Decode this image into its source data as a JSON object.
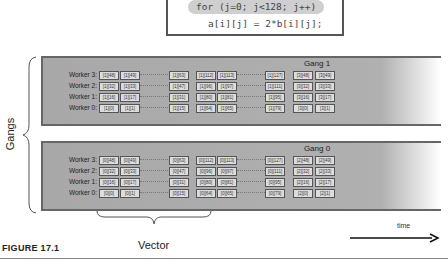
{
  "code": {
    "line1": "for (j=0; j<128; j++)",
    "line2": "a[i][j] = 2*b[i][j];"
  },
  "gangs": [
    {
      "title": "Gang 1",
      "rows": [
        {
          "label": "Worker 3:",
          "cells": [
            "[1][48]",
            "[1][49]",
            "[1][63]",
            "[1][112]",
            "[1][113]",
            "[1][127]",
            "[3][48]",
            "[3][49]"
          ]
        },
        {
          "label": "Worker 2:",
          "cells": [
            "[1][32]",
            "[1][33]",
            "[1][47]",
            "[1][96]",
            "[1][97]",
            "[1][111]",
            "[3][32]",
            "[3][33]"
          ]
        },
        {
          "label": "Worker 1:",
          "cells": [
            "[1][16]",
            "[1][17]",
            "[1][31]",
            "[1][80]",
            "[1][81]",
            "[1][95]",
            "[3][16]",
            "[3][17]"
          ]
        },
        {
          "label": "Worker 0:",
          "cells": [
            "[1][0]",
            "[1][1]",
            "[1][15]",
            "[1][64]",
            "[1][65]",
            "[1][79]",
            "[3][0]",
            "[3][1]"
          ]
        }
      ]
    },
    {
      "title": "Gang 0",
      "rows": [
        {
          "label": "Worker 3:",
          "cells": [
            "[0][48]",
            "[0][49]",
            "[0][63]",
            "[0][112]",
            "[0][113]",
            "[0][127]",
            "[2][48]",
            "[2][49]"
          ]
        },
        {
          "label": "Worker 2:",
          "cells": [
            "[0][32]",
            "[0][33]",
            "[0][47]",
            "[0][96]",
            "[0][97]",
            "[0][111]",
            "[2][32]",
            "[2][33]"
          ]
        },
        {
          "label": "Worker 1:",
          "cells": [
            "[0][16]",
            "[0][17]",
            "[0][31]",
            "[0][80]",
            "[0][81]",
            "[0][95]",
            "[2][16]",
            "[2][17]"
          ]
        },
        {
          "label": "Worker 0:",
          "cells": [
            "[0][0]",
            "[0][1]",
            "[0][15]",
            "[0][64]",
            "[0][65]",
            "[0][79]",
            "[2][0]",
            "[2][1]"
          ]
        }
      ]
    }
  ],
  "labels": {
    "gangs": "Gangs",
    "vector": "Vector",
    "time": "time",
    "figure": "FIGURE 17.1"
  }
}
